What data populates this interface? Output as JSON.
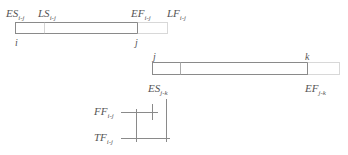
{
  "diagram": {
    "activity_ij": {
      "start_node": "i",
      "end_node": "j",
      "labels": {
        "es": {
          "main": "ES",
          "sub": "i-j"
        },
        "ls": {
          "main": "LS",
          "sub": "i-j"
        },
        "ef": {
          "main": "EF",
          "sub": "i-j"
        },
        "lf": {
          "main": "LF",
          "sub": "i-j"
        }
      }
    },
    "activity_jk": {
      "start_node": "j",
      "end_node": "k",
      "labels": {
        "es": {
          "main": "ES",
          "sub": "j-k"
        },
        "ef": {
          "main": "EF",
          "sub": "j-k"
        }
      }
    },
    "float_legend": {
      "ff": {
        "main": "FF",
        "sub": "i-j"
      },
      "tf": {
        "main": "TF",
        "sub": "i-j"
      }
    },
    "colors": {
      "line": "#8a8a8a",
      "dotted": "#b0b0b0",
      "text": "#555555"
    }
  }
}
